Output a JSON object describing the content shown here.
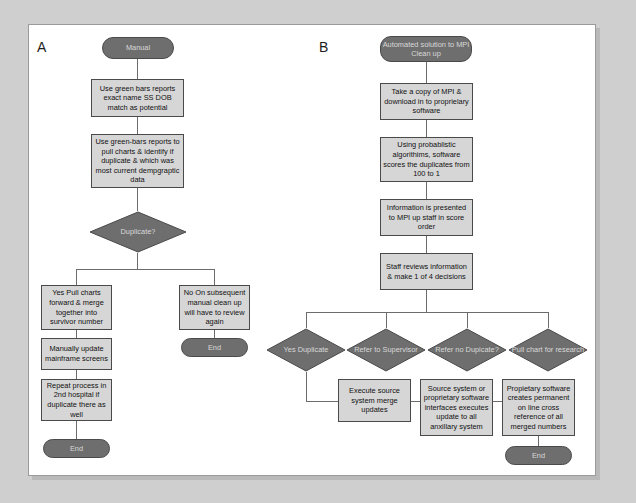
{
  "figure": {
    "background_color": "#cfcfcf",
    "canvas_color": "#ffffff",
    "node_fill": "#d6d6d6",
    "terminator_fill": "#6e6e6e",
    "decision_fill": "#6e6e6e",
    "border_color": "#4a4a4a",
    "connector_color": "#6c6c6c"
  },
  "panels": {
    "a": {
      "label": "A"
    },
    "b": {
      "label": "B"
    }
  },
  "panel_a": {
    "start": "Manual",
    "steps": [
      "Use green bars reports exact name SS DOB match as potential",
      "Use green-bars reports to pull charts & identify if duplicate & which was most current dempgraptic data"
    ],
    "decision": "Duplicate?",
    "yes_branch": {
      "step": "Yes\nPull charts forward & merge together into survivor number",
      "step2": "Manually update mainframe screens",
      "step3": "Repeat process in 2nd hospital if duplicate there as well",
      "end": "End"
    },
    "no_branch": {
      "step": "No\nOn subsequent manual clean up will have to review again",
      "end": "End"
    }
  },
  "panel_b": {
    "start": "Automated solution to MPI Clean up",
    "steps": [
      "Take a copy of MPI & download in to proprielary software",
      "Using probablistic algorithims, software scores the duplicates from 100 to 1",
      "Information is presented to MPI up staff in score order",
      "Staff reviews information & make 1 of 4 decisions"
    ],
    "decisions": [
      "Yes Duplicate",
      "Refer to Supervisor",
      "Refer no Dupicate?",
      "Pull chart for research"
    ],
    "outcomes": [
      "Execute source system merge updates",
      "Source system or proprietary software interfaces executes update to all anxillary system",
      "Propietary software creates permanent on line cross reference of all merged numbers"
    ],
    "end": "End"
  }
}
